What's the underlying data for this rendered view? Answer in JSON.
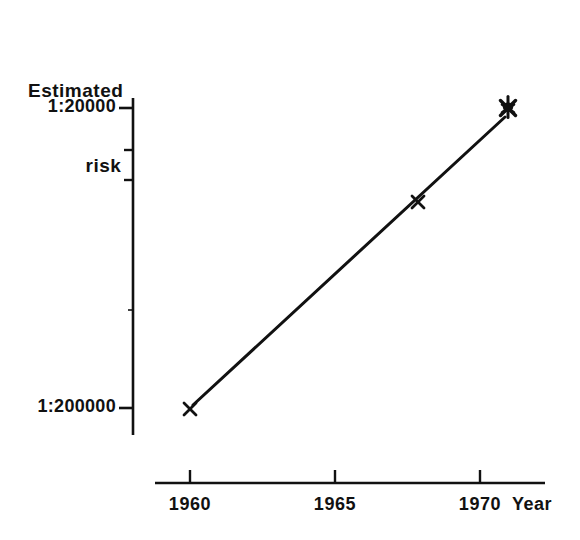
{
  "figure": {
    "background_color": "#ffffff",
    "ink_color": "#111111"
  },
  "axis_titles": {
    "y_line1": "Estimated",
    "y_line2": "risk",
    "x": "Year"
  },
  "y_axis": {
    "ticks": [
      {
        "label": "1:20000",
        "y_px": 108,
        "major": true
      },
      {
        "label": "",
        "y_px": 150,
        "major": false
      },
      {
        "label": "",
        "y_px": 180,
        "major": false
      },
      {
        "label": "",
        "y_px": 310,
        "major": false
      },
      {
        "label": "1:200000",
        "y_px": 408,
        "major": true
      }
    ],
    "line": {
      "x_px": 133,
      "y_top_px": 98,
      "y_bottom_px": 435
    }
  },
  "x_axis": {
    "ticks": [
      {
        "label": "1960",
        "x_px": 190
      },
      {
        "label": "1965",
        "x_px": 335
      },
      {
        "label": "1970",
        "x_px": 480
      }
    ],
    "line": {
      "y_px": 483,
      "x_left_px": 155,
      "x_right_px": 545
    },
    "title_x_px": 512
  },
  "markers": [
    {
      "name": "point-1961",
      "x_px": 190,
      "y_px": 408,
      "glyph": "x",
      "overlapping": false
    },
    {
      "name": "point-1968",
      "x_px": 418,
      "y_px": 201,
      "glyph": "x",
      "overlapping": false
    },
    {
      "name": "point-cluster",
      "x_px": 508,
      "y_px": 107,
      "glyph": "x",
      "overlapping": true
    }
  ],
  "trend_line": {
    "x1_px": 193,
    "y1_px": 405,
    "x2_px": 505,
    "y2_px": 117
  },
  "chart_data": {
    "type": "line",
    "title": "",
    "xlabel": "Year",
    "ylabel": "Estimated risk",
    "y_scale": "log",
    "y_tick_labels": [
      "1:200000",
      "1:20000"
    ],
    "x_tick_labels": [
      "1960",
      "1965",
      "1970"
    ],
    "xlim": [
      1958.8,
      1972.4
    ],
    "ylim": [
      "1:200000",
      "1:20000"
    ],
    "grid": false,
    "legend": "none",
    "series": [
      {
        "name": "Estimated risk",
        "marker": "x",
        "x": [
          1961.0,
          1967.9,
          1971.0
        ],
        "y_labels": [
          "1:200000",
          "1:62000",
          "1:20000"
        ],
        "y_ratio_denominator": [
          200000,
          62000,
          20000
        ],
        "notes": [
          "single x marker at lower left",
          "single x marker mid-plot",
          "several overlapping x markers drawn as one dark blob"
        ]
      }
    ],
    "annotations": [
      "Straight line drawn through the points on a logarithmic risk axis",
      "Axes are drawn detached: y-axis and x-axis do not meet"
    ]
  }
}
